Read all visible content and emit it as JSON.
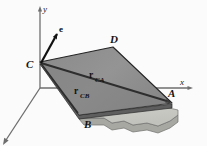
{
  "figure": {
    "background_color": "#fbfbfb",
    "axes": {
      "y_label": "y",
      "x_label": "x",
      "axis_color": "#5a5a5a"
    },
    "points": {
      "c_label": "C",
      "d_label": "D",
      "a_label": "A",
      "b_label": "B"
    },
    "vectors": {
      "unit_vector_label": "e",
      "r_ca_main": "r",
      "r_ca_sub": "CA",
      "r_cb_main": "r",
      "r_cb_sub": "CB",
      "arrow_color": "#111111",
      "vector_line_color": "#3a3a3a"
    },
    "surfaces": {
      "upper_plate_color": "#8c8c8c",
      "upper_plate_edge_color": "#2b2b2b",
      "lower_plate_color": "#c9c9c4",
      "lower_plate_side_color": "#a5a5a0",
      "triangle_shade_color": "#9a9a9a"
    }
  }
}
